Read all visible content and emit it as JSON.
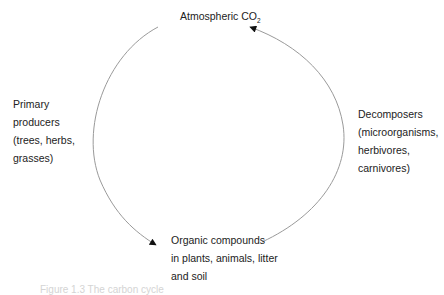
{
  "diagram": {
    "title_node": {
      "text": "Atmospheric CO",
      "subscript": "2"
    },
    "left_node": {
      "lines": [
        "Primary",
        "producers",
        "(trees, herbs,",
        "grasses)"
      ]
    },
    "right_node": {
      "lines": [
        "Decomposers",
        "(microorganisms,",
        "herbivores,",
        "carnivores)"
      ]
    },
    "bottom_node": {
      "lines": [
        "Organic compounds",
        "in plants, animals, litter",
        "and soil"
      ]
    },
    "edges": [
      {
        "from": "Atmospheric CO2",
        "to": "Organic compounds",
        "via": "Primary producers",
        "side": "left"
      },
      {
        "from": "Organic compounds",
        "to": "Atmospheric CO2",
        "via": "Decomposers",
        "side": "right"
      }
    ],
    "colors": {
      "arc": "#9a9a9a",
      "arrowhead": "#111111",
      "text": "#222222"
    },
    "caption": "Figure 1.3  The carbon cycle"
  }
}
